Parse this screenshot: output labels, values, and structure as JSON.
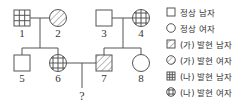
{
  "pedigree": {
    "individuals": [
      {
        "id": "1",
        "sex": "male",
        "phenotype": "na"
      },
      {
        "id": "2",
        "sex": "female",
        "phenotype": "ga"
      },
      {
        "id": "3",
        "sex": "male",
        "phenotype": "normal"
      },
      {
        "id": "4",
        "sex": "female",
        "phenotype": "na"
      },
      {
        "id": "5",
        "sex": "male",
        "phenotype": "normal"
      },
      {
        "id": "6",
        "sex": "female",
        "phenotype": "na"
      },
      {
        "id": "7",
        "sex": "male",
        "phenotype": "ga"
      },
      {
        "id": "8",
        "sex": "female",
        "phenotype": "normal"
      }
    ],
    "unknown_child_label": "?",
    "couples": [
      [
        "1",
        "2"
      ],
      [
        "3",
        "4"
      ],
      [
        "6",
        "7"
      ]
    ],
    "children": {
      "1-2": [
        "5",
        "6"
      ],
      "3-4": [
        "7",
        "8"
      ],
      "6-7": [
        "?"
      ]
    }
  },
  "legend": [
    {
      "symbol": "square-plain",
      "label": "정상 남자"
    },
    {
      "symbol": "circle-plain",
      "label": "정상 여자"
    },
    {
      "symbol": "square-hatch",
      "label": "(가) 발현 남자"
    },
    {
      "symbol": "circle-hatch",
      "label": "(가) 발현 여자"
    },
    {
      "symbol": "square-grid",
      "label": "(나) 발현 남자"
    },
    {
      "symbol": "circle-grid",
      "label": "(나) 발현 여자"
    }
  ]
}
